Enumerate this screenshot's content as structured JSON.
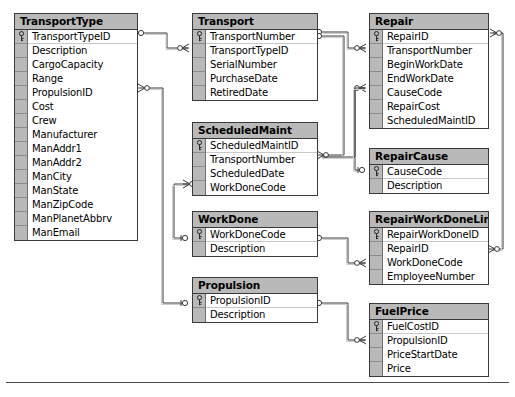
{
  "diagram": {
    "type": "entity-relationship-diagram",
    "notation": "crow's foot",
    "colors": {
      "entity_header_fill": "#b9b9b9",
      "entity_body_fill": "#ffffff",
      "entity_border": "#3a3a3a",
      "gutter_fill": "#b9b9b9",
      "connector_line": "#3a3a3a",
      "page_background": "#ffffff"
    },
    "entities": [
      {
        "id": "transporttype",
        "name": "TransportType",
        "x": 14,
        "y": 13,
        "width": 124,
        "fields": [
          {
            "name": "TransportTypeID",
            "pk": true
          },
          {
            "name": "Description",
            "pk": false
          },
          {
            "name": "CargoCapacity",
            "pk": false
          },
          {
            "name": "Range",
            "pk": false
          },
          {
            "name": "PropulsionID",
            "pk": false
          },
          {
            "name": "Cost",
            "pk": false
          },
          {
            "name": "Crew",
            "pk": false
          },
          {
            "name": "Manufacturer",
            "pk": false
          },
          {
            "name": "ManAddr1",
            "pk": false
          },
          {
            "name": "ManAddr2",
            "pk": false
          },
          {
            "name": "ManCity",
            "pk": false
          },
          {
            "name": "ManState",
            "pk": false
          },
          {
            "name": "ManZipCode",
            "pk": false
          },
          {
            "name": "ManPlanetAbbrv",
            "pk": false
          },
          {
            "name": "ManEmail",
            "pk": false
          }
        ]
      },
      {
        "id": "transport",
        "name": "Transport",
        "x": 192,
        "y": 13,
        "width": 126,
        "fields": [
          {
            "name": "TransportNumber",
            "pk": true
          },
          {
            "name": "TransportTypeID",
            "pk": false
          },
          {
            "name": "SerialNumber",
            "pk": false
          },
          {
            "name": "PurchaseDate",
            "pk": false
          },
          {
            "name": "RetiredDate",
            "pk": false
          }
        ]
      },
      {
        "id": "scheduledmaint",
        "name": "ScheduledMaint",
        "x": 192,
        "y": 122,
        "width": 126,
        "fields": [
          {
            "name": "ScheduledMaintID",
            "pk": true
          },
          {
            "name": "TransportNumber",
            "pk": false
          },
          {
            "name": "ScheduledDate",
            "pk": false
          },
          {
            "name": "WorkDoneCode",
            "pk": false
          }
        ]
      },
      {
        "id": "workdone",
        "name": "WorkDone",
        "x": 192,
        "y": 211,
        "width": 126,
        "fields": [
          {
            "name": "WorkDoneCode",
            "pk": true
          },
          {
            "name": "Description",
            "pk": false
          }
        ]
      },
      {
        "id": "propulsion",
        "name": "Propulsion",
        "x": 192,
        "y": 277,
        "width": 126,
        "fields": [
          {
            "name": "PropulsionID",
            "pk": true
          },
          {
            "name": "Description",
            "pk": false
          }
        ]
      },
      {
        "id": "repair",
        "name": "Repair",
        "x": 369,
        "y": 13,
        "width": 120,
        "fields": [
          {
            "name": "RepairID",
            "pk": true
          },
          {
            "name": "TransportNumber",
            "pk": false
          },
          {
            "name": "BeginWorkDate",
            "pk": false
          },
          {
            "name": "EndWorkDate",
            "pk": false
          },
          {
            "name": "CauseCode",
            "pk": false
          },
          {
            "name": "RepairCost",
            "pk": false
          },
          {
            "name": "ScheduledMaintID",
            "pk": false
          }
        ]
      },
      {
        "id": "repaircause",
        "name": "RepairCause",
        "x": 369,
        "y": 148,
        "width": 120,
        "fields": [
          {
            "name": "CauseCode",
            "pk": true
          },
          {
            "name": "Description",
            "pk": false
          }
        ]
      },
      {
        "id": "repairworkdonelink",
        "name": "RepairWorkDoneLink",
        "x": 369,
        "y": 211,
        "width": 120,
        "fields": [
          {
            "name": "RepairWorkDoneID",
            "pk": true
          },
          {
            "name": "RepairID",
            "pk": false
          },
          {
            "name": "WorkDoneCode",
            "pk": false
          },
          {
            "name": "EmployeeNumber",
            "pk": false
          }
        ]
      },
      {
        "id": "fuelprice",
        "name": "FuelPrice",
        "x": 369,
        "y": 303,
        "width": 120,
        "fields": [
          {
            "name": "FuelCostID",
            "pk": true
          },
          {
            "name": "PropulsionID",
            "pk": false
          },
          {
            "name": "PriceStartDate",
            "pk": false
          },
          {
            "name": "Price",
            "pk": false
          }
        ]
      }
    ],
    "relationships": [
      {
        "from": "TransportType.TransportTypeID",
        "to": "Transport.TransportTypeID",
        "cardinality": "one-to-many"
      },
      {
        "from": "TransportType.PropulsionID",
        "to": "Propulsion.PropulsionID",
        "cardinality": "many-to-one"
      },
      {
        "from": "Transport.TransportNumber",
        "to": "Repair.TransportNumber",
        "cardinality": "one-to-many"
      },
      {
        "from": "Transport.TransportNumber",
        "to": "ScheduledMaint.TransportNumber",
        "cardinality": "one-to-many"
      },
      {
        "from": "ScheduledMaint.ScheduledMaintID",
        "to": "Repair.ScheduledMaintID",
        "cardinality": "one-to-many"
      },
      {
        "from": "ScheduledMaint.WorkDoneCode",
        "to": "WorkDone.WorkDoneCode",
        "cardinality": "many-to-one"
      },
      {
        "from": "Repair.RepairID",
        "to": "RepairWorkDoneLink.RepairID",
        "cardinality": "one-to-many"
      },
      {
        "from": "Repair.CauseCode",
        "to": "RepairCause.CauseCode",
        "cardinality": "many-to-one"
      },
      {
        "from": "WorkDone.WorkDoneCode",
        "to": "RepairWorkDoneLink.WorkDoneCode",
        "cardinality": "one-to-many"
      },
      {
        "from": "Propulsion.PropulsionID",
        "to": "FuelPrice.PropulsionID",
        "cardinality": "one-to-many"
      }
    ],
    "footer": {
      "divider_visible": true
    }
  }
}
